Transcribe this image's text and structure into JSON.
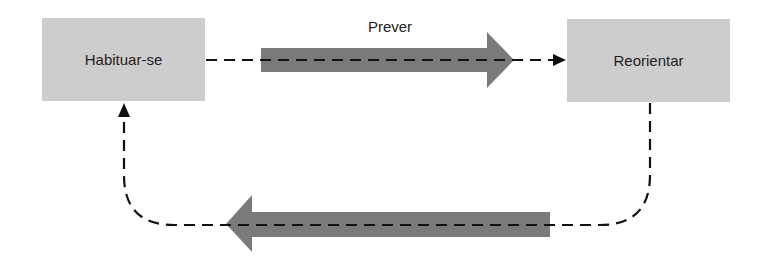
{
  "diagram": {
    "nodes": [
      {
        "id": "habituar",
        "label": "Habituar-se"
      },
      {
        "id": "reorientar",
        "label": "Reorientar"
      }
    ],
    "edges": [
      {
        "from": "habituar",
        "to": "reorientar",
        "label": "Prever",
        "style": "dashed",
        "emphasis_arrow": "right"
      },
      {
        "from": "reorientar",
        "to": "habituar",
        "label": "",
        "style": "dashed",
        "emphasis_arrow": "left"
      }
    ],
    "colors": {
      "node_fill": "#cdcdcd",
      "big_arrow_fill": "#7a7a7a",
      "line": "#111111",
      "text": "#1e1e1e"
    }
  }
}
